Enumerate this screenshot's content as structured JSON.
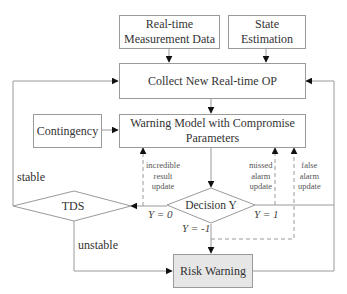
{
  "nodes": {
    "measurement": {
      "label_line1": "Real-time",
      "label_line2": "Measurement Data"
    },
    "state_estimation": {
      "label_line1": "State",
      "label_line2": "Estimation"
    },
    "collect": {
      "label": "Collect New Real-time OP"
    },
    "contingency": {
      "label": "Contingency"
    },
    "warning_model": {
      "label_line1": "Warning Model with Compromise",
      "label_line2": "Parameters"
    },
    "decision": {
      "label": "Decision Y"
    },
    "tds": {
      "label": "TDS"
    },
    "risk_warning": {
      "label": "Risk Warning"
    }
  },
  "edge_labels": {
    "stable": "stable",
    "unstable": "unstable",
    "y0": "Y = 0",
    "y1": "Y = 1",
    "yneg1": "Y = -1",
    "incredible": [
      "incredible",
      "result",
      "update"
    ],
    "missed": [
      "missed",
      "alarm",
      "update"
    ],
    "false_alarm": [
      "false",
      "alarm",
      "update"
    ]
  },
  "colors": {
    "line": "#9a9a9a",
    "arrow": "#111111",
    "risk_fill": "#e6e6e6"
  }
}
